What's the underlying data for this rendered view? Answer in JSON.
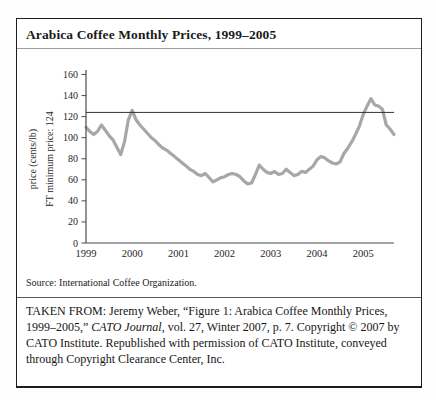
{
  "figure": {
    "title": "Arabica Coffee Monthly Prices, 1999–2005",
    "source": "Source: International Coffee Organization.",
    "attribution": {
      "part1": "TAKEN FROM: Jeremy Weber, “Figure 1: Arabica Coffee Monthly Prices, 1999–2005,” ",
      "italic": "CATO Journal",
      "part2": ", vol. 27, Winter 2007, p. 7. Copyright © 2007 by CATO Institute. Republished with permission of CATO Institute, conveyed through Copyright Clearance Center, Inc."
    }
  },
  "chart_data": {
    "type": "line",
    "title": "Arabica Coffee Monthly Prices, 1999–2005",
    "ylabel": "price (cents/lb)",
    "ylabel2": "FT minimum price: 124",
    "xlabel": "",
    "x_tick_labels": [
      "1999",
      "2000",
      "2001",
      "2002",
      "2003",
      "2004",
      "2005"
    ],
    "y_ticks": [
      0,
      20,
      40,
      60,
      80,
      100,
      120,
      140,
      160
    ],
    "ylim": [
      0,
      160
    ],
    "grid": false,
    "legend": "none",
    "reference_line": {
      "label": "FT minimum price",
      "value": 124,
      "color": "#333333"
    },
    "series": [
      {
        "name": "Arabica coffee monthly price (cents/lb)",
        "color": "#a7a7a7",
        "x_start": "1999-01",
        "x_step_months": 1,
        "values": [
          110,
          106,
          103,
          106,
          112,
          107,
          102,
          98,
          91,
          84,
          96,
          117,
          126,
          117,
          112,
          108,
          104,
          100,
          97,
          93,
          90,
          88,
          85,
          82,
          79,
          76,
          73,
          70,
          68,
          65,
          64,
          66,
          62,
          58,
          60,
          62,
          63,
          65,
          66,
          65,
          63,
          59,
          56,
          57,
          65,
          74,
          70,
          67,
          66,
          68,
          65,
          66,
          70,
          67,
          64,
          65,
          68,
          67,
          70,
          73,
          79,
          82,
          81,
          78,
          76,
          75,
          77,
          85,
          90,
          96,
          103,
          111,
          122,
          130,
          137,
          131,
          130,
          127,
          112,
          108,
          103
        ]
      }
    ]
  }
}
